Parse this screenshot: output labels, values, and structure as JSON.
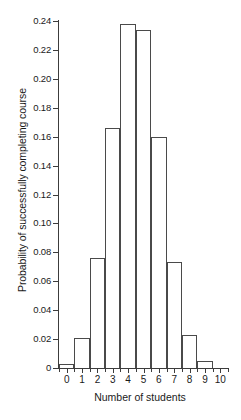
{
  "chart_data": {
    "type": "bar",
    "title": "",
    "subtitle": "",
    "xlabel": "Number of students",
    "ylabel": "Probability of successfully completing course",
    "categories": [
      "0",
      "1",
      "2",
      "3",
      "4",
      "5",
      "6",
      "7",
      "8",
      "9",
      "10"
    ],
    "values": [
      0.003,
      0.021,
      0.076,
      0.166,
      0.238,
      0.234,
      0.16,
      0.073,
      0.023,
      0.005,
      0.0
    ],
    "series": [
      {
        "name": "Probability of successfully completing course",
        "values": [
          0.003,
          0.021,
          0.076,
          0.166,
          0.238,
          0.234,
          0.16,
          0.073,
          0.023,
          0.005,
          0.0
        ]
      }
    ],
    "xlim": [
      -0.5,
      10.5
    ],
    "ylim": [
      0,
      0.24
    ],
    "ytick_labels": [
      "0",
      "0.02",
      "0.04",
      "0.06",
      "0.08",
      "0.10",
      "0.12",
      "0.14",
      "0.16",
      "0.18",
      "0.20",
      "0.22",
      "0.24"
    ],
    "ytick_values": [
      0,
      0.02,
      0.04,
      0.06,
      0.08,
      0.1,
      0.12,
      0.14,
      0.16,
      0.18,
      0.2,
      0.22,
      0.24
    ],
    "xtick_labels": [
      "0",
      "1",
      "2",
      "3",
      "4",
      "5",
      "6",
      "7",
      "8",
      "9",
      "10"
    ],
    "xtick_values": [
      0,
      1,
      2,
      3,
      4,
      5,
      6,
      7,
      8,
      9,
      10
    ],
    "grid": false,
    "legend": null,
    "legend_position": "none",
    "bar_style": "outline",
    "bar_edge_color": "#4a4a4a",
    "bar_fill_color": "#ffffff",
    "axis_color": "#3c3c3c",
    "background_color": "#ffffff",
    "annotations": []
  }
}
